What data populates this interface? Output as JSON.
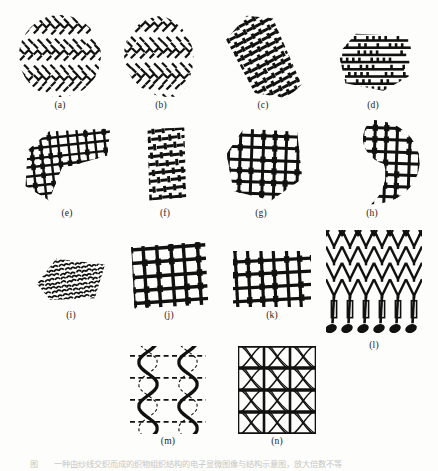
{
  "figure": {
    "background_color": "#fdfdfb",
    "ink_color": "#111111",
    "label_color": "#1c1c1c",
    "caption_number": "图",
    "caption_text": "一种由纱线交织而成的织物组织结构的电子显微图像与结构示意图，放大倍数不等",
    "panel_count": 14,
    "rows": 4
  },
  "panels": [
    {
      "id": "a",
      "label": "(a)",
      "weave": "herringbone-twill",
      "shape": "circle",
      "x": 18,
      "y": 14,
      "w": 84,
      "h": 84,
      "label_y": 100
    },
    {
      "id": "b",
      "label": "(b)",
      "weave": "herringbone-twill",
      "shape": "leaf",
      "x": 120,
      "y": 14,
      "w": 82,
      "h": 86,
      "label_y": 100
    },
    {
      "id": "c",
      "label": "(c)",
      "weave": "plain-weave",
      "shape": "diagonal-band",
      "x": 222,
      "y": 14,
      "w": 82,
      "h": 86,
      "label_y": 100
    },
    {
      "id": "d",
      "label": "(d)",
      "weave": "weft-rib",
      "shape": "blob",
      "x": 330,
      "y": 30,
      "w": 86,
      "h": 62,
      "label_y": 100
    },
    {
      "id": "e",
      "label": "(e)",
      "weave": "open-mesh-grid",
      "shape": "crescent",
      "x": 22,
      "y": 122,
      "w": 90,
      "h": 80,
      "label_y": 208
    },
    {
      "id": "f",
      "label": "(f)",
      "weave": "narrow-plain",
      "shape": "strip",
      "x": 142,
      "y": 126,
      "w": 46,
      "h": 76,
      "label_y": 208
    },
    {
      "id": "g",
      "label": "(g)",
      "weave": "coarse-grid",
      "shape": "blob",
      "x": 218,
      "y": 124,
      "w": 86,
      "h": 78,
      "label_y": 208
    },
    {
      "id": "h",
      "label": "(h)",
      "weave": "coarse-grid",
      "shape": "crescent-disc",
      "x": 322,
      "y": 118,
      "w": 100,
      "h": 88,
      "label_y": 208
    },
    {
      "id": "i",
      "label": "(i)",
      "weave": "fine-twill",
      "shape": "lens",
      "x": 34,
      "y": 254,
      "w": 74,
      "h": 48,
      "label_y": 310
    },
    {
      "id": "j",
      "label": "(j)",
      "weave": "open-leno-grid",
      "shape": "square",
      "x": 128,
      "y": 240,
      "w": 82,
      "h": 70,
      "label_y": 310
    },
    {
      "id": "k",
      "label": "(k)",
      "weave": "open-grid",
      "shape": "rect",
      "x": 232,
      "y": 250,
      "w": 80,
      "h": 58,
      "label_y": 310
    },
    {
      "id": "l",
      "label": "(l)",
      "weave": "knitted-net-fringe",
      "shape": "rect",
      "x": 326,
      "y": 230,
      "w": 96,
      "h": 106,
      "label_y": 340
    },
    {
      "id": "m",
      "label": "(m)",
      "weave": "leno-gauze-diagram",
      "shape": "diagram",
      "x": 128,
      "y": 346,
      "w": 80,
      "h": 88,
      "label_y": 436
    },
    {
      "id": "n",
      "label": "(n)",
      "weave": "cross-weave-diagram",
      "shape": "diagram",
      "x": 238,
      "y": 346,
      "w": 78,
      "h": 88,
      "label_y": 436
    }
  ]
}
